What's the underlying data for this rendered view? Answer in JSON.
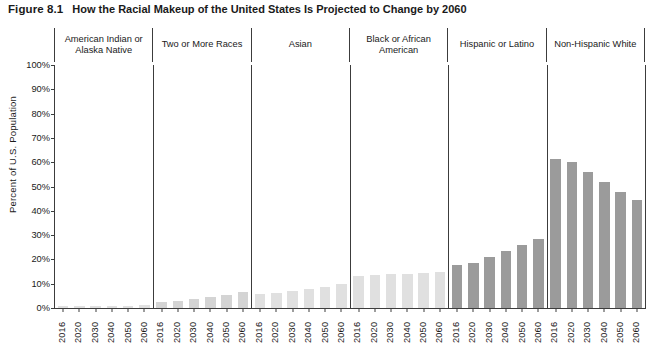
{
  "caption": {
    "figure_number": "Figure 8.1",
    "title": "How the Racial Makeup of the United States Is Projected to Change by 2060"
  },
  "chart_data": {
    "type": "bar",
    "title": "How the Racial Makeup of the United States Is Projected to Change by 2060",
    "xlabel": "",
    "ylabel": "Percent of U.S. Population",
    "ylim": [
      0,
      100
    ],
    "yticks": [
      "0%",
      "10%",
      "20%",
      "30%",
      "40%",
      "50%",
      "60%",
      "70%",
      "80%",
      "90%",
      "100%"
    ],
    "ytick_values": [
      0,
      10,
      20,
      30,
      40,
      50,
      60,
      70,
      80,
      90,
      100
    ],
    "grid": false,
    "legend": "none",
    "categories": [
      "2016",
      "2020",
      "2030",
      "2040",
      "2050",
      "2060"
    ],
    "panels": [
      {
        "label": "American Indian or Alaska Native",
        "shade": "light",
        "values": [
          1.0,
          1.0,
          1.0,
          1.0,
          1.0,
          1.1
        ]
      },
      {
        "label": "Two or More Races",
        "shade": "midlight",
        "values": [
          2.5,
          2.8,
          3.6,
          4.5,
          5.4,
          6.5
        ]
      },
      {
        "label": "Asian",
        "shade": "light",
        "values": [
          5.7,
          6.0,
          6.9,
          7.8,
          8.8,
          9.8
        ]
      },
      {
        "label": "Black or African American",
        "shade": "light",
        "values": [
          13.3,
          13.5,
          13.9,
          14.2,
          14.6,
          15.0
        ]
      },
      {
        "label": "Hispanic or Latino",
        "shade": "dark",
        "values": [
          17.8,
          18.7,
          21.1,
          23.5,
          26.0,
          28.6
        ]
      },
      {
        "label": "Non-Hispanic White",
        "shade": "dark",
        "values": [
          61.3,
          60.1,
          56.0,
          51.7,
          47.9,
          44.3
        ]
      }
    ]
  }
}
